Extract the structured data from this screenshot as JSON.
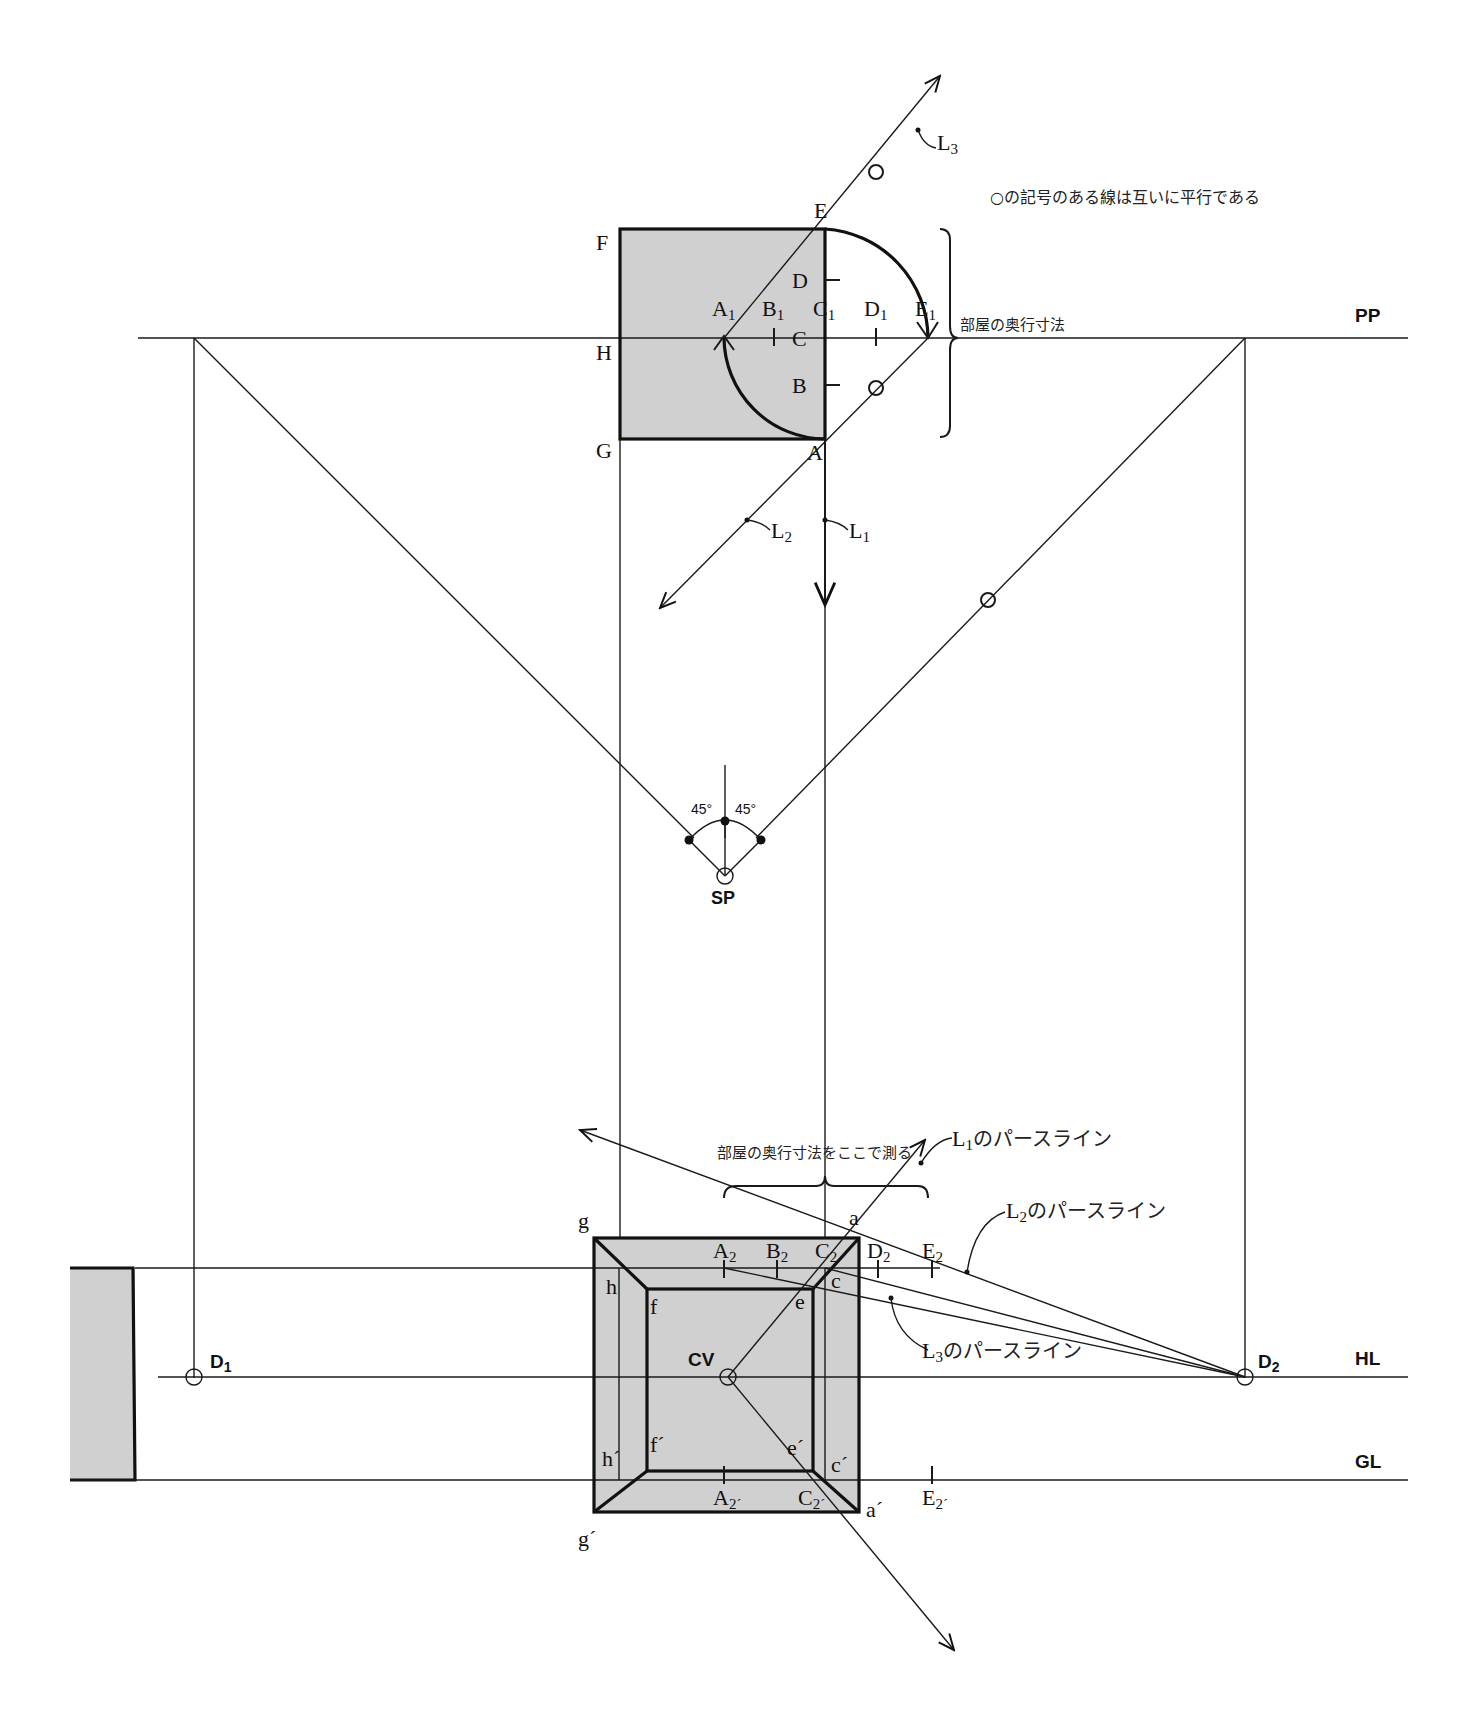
{
  "note": "○の記号のある線は互いに平行である",
  "plan": {
    "corners": {
      "E": "E",
      "F": "F",
      "G": "G",
      "H": "H",
      "A": "A"
    },
    "ticks": {
      "D": "D",
      "B": "B",
      "C": "C"
    },
    "pp_points": [
      "A",
      "B",
      "C",
      "D",
      "E"
    ],
    "room_depth_label": "部屋の奥行寸法",
    "lines": {
      "L1": "L",
      "L2": "L",
      "L3": "L"
    },
    "line_subs": {
      "L1": "1",
      "L2": "2",
      "L3": "3"
    }
  },
  "labels": {
    "PP": "PP",
    "HL": "HL",
    "GL": "GL",
    "SP": "SP",
    "CV": "CV",
    "D1": "D",
    "D1_sub": "1",
    "D2": "D",
    "D2_sub": "2",
    "angle_left": "45°",
    "angle_right": "45°"
  },
  "perspective": {
    "measure_label": "部屋の奥行寸法をここで測る",
    "L1_pers": "のパースライン",
    "L2_pers": "のパースライン",
    "L3_pers": "のパースライン",
    "top_points": [
      "A",
      "B",
      "C",
      "D",
      "E"
    ],
    "bottom_points": [
      "A",
      "C",
      "E"
    ],
    "corners": {
      "g": "g",
      "a": "a",
      "h": "h",
      "c": "c",
      "f": "f",
      "e": "e",
      "g_p": "g´",
      "a_p": "a´",
      "h_p": "h´",
      "c_p": "c´",
      "f_p": "f´",
      "e_p": "e´"
    }
  }
}
